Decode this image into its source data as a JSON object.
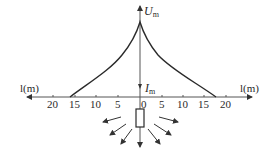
{
  "diagram": {
    "type": "ground potential distribution around grounding electrode",
    "vertical_axis": {
      "top_label_symbol": "U",
      "top_label_subscript": "m",
      "lower_label_symbol": "I",
      "lower_label_subscript": "m"
    },
    "horizontal_axis": {
      "left_label": "l(m)",
      "right_label": "l(m)",
      "left_ticks": [
        "20",
        "15",
        "10",
        "5"
      ],
      "center_tick": "0",
      "right_ticks": [
        "0",
        "5",
        "10",
        "15",
        "20"
      ]
    },
    "curve": {
      "peak": "U_m at l = 0",
      "left_zero_crossing_m": 16,
      "right_zero_crossing_m": 18
    },
    "electrode": {
      "shape": "rectangle",
      "current_arrows": 7
    },
    "colors": {
      "line": "#2a2a2a",
      "axis": "#555555",
      "background": "#ffffff"
    }
  }
}
